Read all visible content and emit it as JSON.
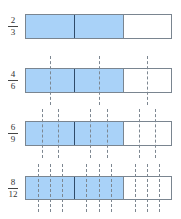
{
  "diagram": {
    "title": "",
    "colors": {
      "fill": "#a9d2f8",
      "border": "#7a8590",
      "third_divider": "#2f4b6a",
      "dash": "#7d8791"
    },
    "rows": [
      {
        "numerator": "2",
        "denominator": "3",
        "parts": 3,
        "shaded": 2,
        "subdivisions": 1
      },
      {
        "numerator": "4",
        "denominator": "6",
        "parts": 6,
        "shaded": 4,
        "subdivisions": 2
      },
      {
        "numerator": "6",
        "denominator": "9",
        "parts": 9,
        "shaded": 6,
        "subdivisions": 3
      },
      {
        "numerator": "8",
        "denominator": "12",
        "parts": 12,
        "shaded": 8,
        "subdivisions": 4
      }
    ]
  }
}
